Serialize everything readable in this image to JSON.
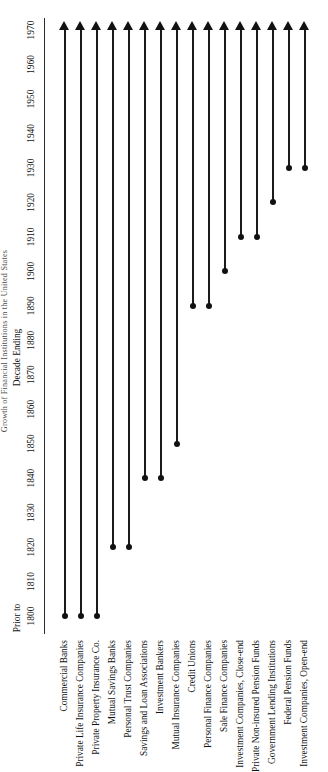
{
  "figure": {
    "title": "Growth of Financial Institutions in the United States",
    "axis_caption": "Decade  Ending",
    "prior_label": "Prior to",
    "axis_min_label": "1800",
    "axis_max_label": "1970"
  },
  "chart_data": {
    "type": "bar",
    "title": "Growth of Financial Institutions in the United States",
    "xlabel": "Decade  Ending",
    "ylabel": "",
    "orientation": "horizontal-timeline",
    "xlim": [
      1795,
      1975
    ],
    "grid": false,
    "legend": "none",
    "tick_labels": [
      "1800",
      "1810",
      "1820",
      "1830",
      "1840",
      "1850",
      "1860",
      "1870",
      "1880",
      "1890",
      "1900",
      "1910",
      "1920",
      "1930",
      "1940",
      "1950",
      "1960",
      "1970"
    ],
    "tick_values": [
      1800,
      1810,
      1820,
      1830,
      1840,
      1850,
      1860,
      1870,
      1880,
      1890,
      1900,
      1910,
      1920,
      1930,
      1940,
      1950,
      1960,
      1970
    ],
    "annotations": [
      "Prior to"
    ],
    "note": "Each row is a bar beginning with a dot at the decade the institution type appeared and ending in an arrowhead at 1970, indicating continuation.",
    "categories": [
      "Commercial Banks",
      "Private Life Insurance Companies",
      "Private Property Insurance Co.",
      "Mutual Savings Banks",
      "Personal Trust Companies",
      "Savings and Loan Associations",
      "Investment Bankers",
      "Mutual Insurance Companies",
      "Credit Unions",
      "Personal Finance Companies",
      "Sale Finance Companies",
      "Investment Companies, Close-end",
      "Private Non-insured Pension Funds",
      "Government Lending Institutions",
      "Federal Pension Funds",
      "Investment Companies, Open-end"
    ],
    "series": [
      {
        "name": "start_year",
        "values": [
          1800,
          1800,
          1800,
          1820,
          1820,
          1840,
          1840,
          1850,
          1890,
          1890,
          1900,
          1910,
          1910,
          1920,
          1930,
          1930
        ]
      },
      {
        "name": "end_year",
        "values": [
          1970,
          1970,
          1970,
          1970,
          1970,
          1970,
          1970,
          1970,
          1970,
          1970,
          1970,
          1970,
          1970,
          1970,
          1970,
          1970
        ]
      }
    ],
    "rows": [
      {
        "label": "Commercial Banks",
        "start_label": "Prior to 1800",
        "start": 1800,
        "end": 1970,
        "open_ended": true
      },
      {
        "label": "Private Life Insurance Companies",
        "start_label": "Prior to 1800",
        "start": 1800,
        "end": 1970,
        "open_ended": true
      },
      {
        "label": "Private Property Insurance Co.",
        "start_label": "Prior to 1800",
        "start": 1800,
        "end": 1970,
        "open_ended": true
      },
      {
        "label": "Mutual Savings Banks",
        "start_label": "1820",
        "start": 1820,
        "end": 1970,
        "open_ended": true
      },
      {
        "label": "Personal Trust Companies",
        "start_label": "1820",
        "start": 1820,
        "end": 1970,
        "open_ended": true
      },
      {
        "label": "Savings and Loan Associations",
        "start_label": "1840",
        "start": 1840,
        "end": 1970,
        "open_ended": true
      },
      {
        "label": "Investment Bankers",
        "start_label": "1840",
        "start": 1840,
        "end": 1970,
        "open_ended": true
      },
      {
        "label": "Mutual Insurance Companies",
        "start_label": "1850",
        "start": 1850,
        "end": 1970,
        "open_ended": true
      },
      {
        "label": "Credit Unions",
        "start_label": "1890",
        "start": 1890,
        "end": 1970,
        "open_ended": true
      },
      {
        "label": "Personal Finance Companies",
        "start_label": "1890",
        "start": 1890,
        "end": 1970,
        "open_ended": true
      },
      {
        "label": "Sale Finance Companies",
        "start_label": "1900",
        "start": 1900,
        "end": 1970,
        "open_ended": true
      },
      {
        "label": "Investment Companies, Close-end",
        "start_label": "1910",
        "start": 1910,
        "end": 1970,
        "open_ended": true
      },
      {
        "label": "Private Non-insured Pension Funds",
        "start_label": "1910",
        "start": 1910,
        "end": 1970,
        "open_ended": true
      },
      {
        "label": "Government Lending Institutions",
        "start_label": "1920",
        "start": 1920,
        "end": 1970,
        "open_ended": true
      },
      {
        "label": "Federal Pension Funds",
        "start_label": "1930",
        "start": 1930,
        "end": 1970,
        "open_ended": true
      },
      {
        "label": "Investment Companies, Open-end",
        "start_label": "1930",
        "start": 1930,
        "end": 1970,
        "open_ended": true
      }
    ]
  }
}
